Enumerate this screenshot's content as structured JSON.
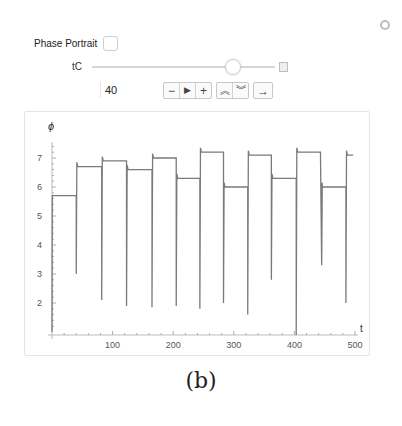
{
  "controls": {
    "phase_portrait_label": "Phase Portrait",
    "phase_portrait_checked": false,
    "slider_label": "tC",
    "slider_value": "40",
    "slider_position_pct": 73,
    "buttons": [
      {
        "name": "decrement",
        "glyph": "−"
      },
      {
        "name": "play",
        "glyph": "▶"
      },
      {
        "name": "increment",
        "glyph": "+"
      },
      {
        "name": "faster",
        "glyph": "≈"
      },
      {
        "name": "slower",
        "glyph": "≋"
      },
      {
        "name": "direction",
        "glyph": "→"
      }
    ],
    "options_icon": "gear-icon"
  },
  "caption": "(b)",
  "chart_data": {
    "type": "line",
    "title": "",
    "xlabel": "t",
    "ylabel": "ϕ",
    "xlim": [
      0,
      510
    ],
    "ylim": [
      0.9,
      7.6
    ],
    "xticks": [
      100,
      200,
      300,
      400,
      500
    ],
    "yticks": [
      2,
      3,
      4,
      5,
      6,
      7
    ],
    "grid": false,
    "color": "#7a7a7a",
    "plateaus": [
      {
        "t_start": 0,
        "t_end": 40,
        "phi": 5.7
      },
      {
        "t_start": 42,
        "t_end": 82,
        "phi": 6.7
      },
      {
        "t_start": 84,
        "t_end": 123,
        "phi": 6.9
      },
      {
        "t_start": 125,
        "t_end": 165,
        "phi": 6.6
      },
      {
        "t_start": 167,
        "t_end": 205,
        "phi": 7.0
      },
      {
        "t_start": 207,
        "t_end": 244,
        "phi": 6.3
      },
      {
        "t_start": 246,
        "t_end": 283,
        "phi": 7.2
      },
      {
        "t_start": 285,
        "t_end": 323,
        "phi": 6.0
      },
      {
        "t_start": 325,
        "t_end": 362,
        "phi": 7.1
      },
      {
        "t_start": 364,
        "t_end": 403,
        "phi": 6.3
      },
      {
        "t_start": 405,
        "t_end": 443,
        "phi": 7.2
      },
      {
        "t_start": 445,
        "t_end": 485,
        "phi": 6.0
      },
      {
        "t_start": 487,
        "t_end": 497,
        "phi": 7.1
      }
    ],
    "dips": [
      {
        "t": 40,
        "phi": 3.0
      },
      {
        "t": 82,
        "phi": 2.1
      },
      {
        "t": 123,
        "phi": 1.9
      },
      {
        "t": 165,
        "phi": 1.85
      },
      {
        "t": 205,
        "phi": 1.9
      },
      {
        "t": 244,
        "phi": 1.8
      },
      {
        "t": 283,
        "phi": 2.0
      },
      {
        "t": 323,
        "phi": 1.6
      },
      {
        "t": 362,
        "phi": 2.8
      },
      {
        "t": 403,
        "phi": 0.9
      },
      {
        "t": 445,
        "phi": 3.3
      },
      {
        "t": 485,
        "phi": 2.0
      }
    ]
  }
}
